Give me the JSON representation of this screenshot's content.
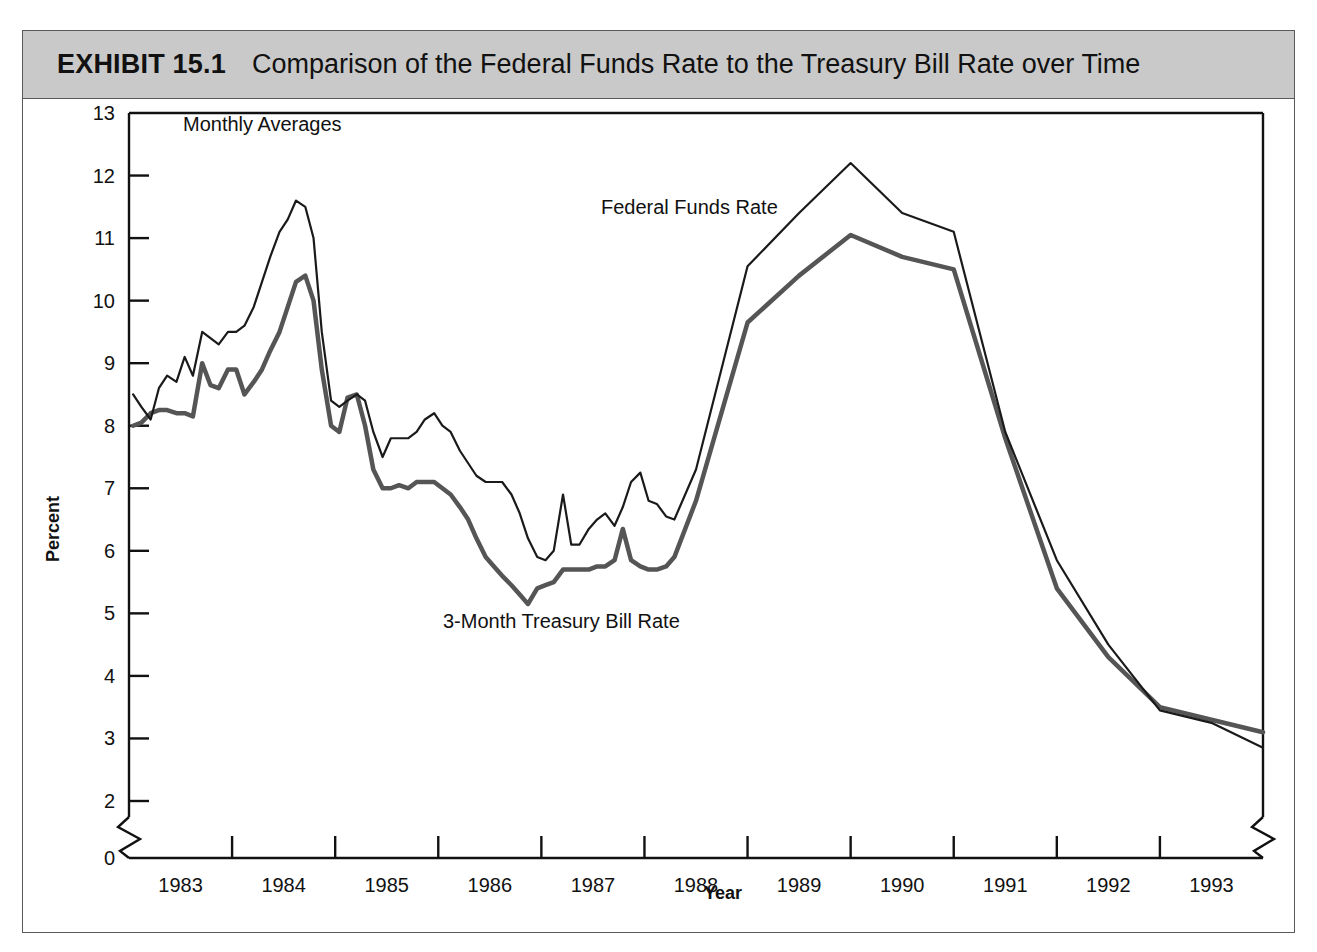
{
  "exhibit": {
    "number": "EXHIBIT 15.1",
    "title": "Comparison of the Federal Funds Rate to the Treasury Bill Rate over Time"
  },
  "annotations": {
    "monthly_averages": "Monthly Averages",
    "federal_funds": "Federal Funds Rate",
    "treasury_bill": "3-Month Treasury Bill Rate"
  },
  "colors": {
    "federal_funds_line": "#1a1a1a",
    "treasury_bill_line": "#555555",
    "axis": "#111111",
    "title_band": "#c9c9c9",
    "frame": "#5a5a5a"
  },
  "chart_data": {
    "type": "line",
    "title": "Comparison of the Federal Funds Rate to the Treasury Bill Rate over Time",
    "subtitle": "Monthly Averages",
    "xlabel": "Year",
    "ylabel": "Percent",
    "xlim": [
      1982.5,
      1993.5
    ],
    "ylim": [
      0,
      13
    ],
    "y_axis_break": [
      0.4,
      2.0
    ],
    "x_axis_break_left": true,
    "x_axis_break_right": true,
    "grid": false,
    "legend": "inline-annotations",
    "ytick_labels": [
      "0",
      "2",
      "3",
      "4",
      "5",
      "6",
      "7",
      "8",
      "9",
      "10",
      "11",
      "12",
      "13"
    ],
    "ytick_values": [
      0,
      2,
      3,
      4,
      5,
      6,
      7,
      8,
      9,
      10,
      11,
      12,
      13
    ],
    "xtick_labels": [
      "1983",
      "1984",
      "1985",
      "1986",
      "1987",
      "1988",
      "1989",
      "1990",
      "1991",
      "1992",
      "1993"
    ],
    "xtick_values": [
      1983,
      1984,
      1985,
      1986,
      1987,
      1988,
      1989,
      1990,
      1991,
      1992,
      1993
    ],
    "x_minor_tick_values": [
      1983.5,
      1984.5,
      1985.5,
      1986.5,
      1987.5,
      1988.5,
      1989.5,
      1990.5,
      1991.5,
      1992.5
    ],
    "series": [
      {
        "name": "Federal Funds Rate",
        "color": "#1a1a1a",
        "width": 2.2,
        "x": [
          1982.54,
          1982.62,
          1982.71,
          1982.79,
          1982.87,
          1982.96,
          1983.04,
          1983.12,
          1983.21,
          1983.29,
          1983.37,
          1983.46,
          1983.54,
          1983.62,
          1983.71,
          1983.79,
          1983.87,
          1983.96,
          1984.04,
          1984.12,
          1984.21,
          1984.29,
          1984.37,
          1984.46,
          1984.54,
          1984.62,
          1984.71,
          1984.79,
          1984.87,
          1984.96,
          1985.04,
          1985.12,
          1985.21,
          1985.29,
          1985.37,
          1985.46,
          1985.54,
          1985.62,
          1985.71,
          1985.79,
          1985.87,
          1985.96,
          1986.04,
          1986.12,
          1986.21,
          1986.29,
          1986.37,
          1986.46,
          1986.54,
          1986.62,
          1986.71,
          1986.79,
          1986.87,
          1986.96,
          1987.04,
          1987.12,
          1987.21,
          1987.29,
          1987.37,
          1987.46,
          1987.54,
          1987.62,
          1987.71,
          1987.79,
          1988.0,
          1988.5,
          1989.0,
          1989.5,
          1990.0,
          1990.5,
          1991.0,
          1991.5,
          1992.0,
          1992.5,
          1993.0,
          1993.5
        ],
        "y": [
          8.5,
          8.3,
          8.1,
          8.6,
          8.8,
          8.7,
          9.1,
          8.8,
          9.5,
          9.4,
          9.3,
          9.5,
          9.5,
          9.6,
          9.9,
          10.3,
          10.7,
          11.1,
          11.3,
          11.6,
          11.5,
          11.0,
          9.5,
          8.4,
          8.3,
          8.4,
          8.5,
          8.4,
          7.9,
          7.5,
          7.8,
          7.8,
          7.8,
          7.9,
          8.1,
          8.2,
          8.0,
          7.9,
          7.6,
          7.4,
          7.2,
          7.1,
          7.1,
          7.1,
          6.9,
          6.6,
          6.2,
          5.9,
          5.85,
          6.0,
          6.9,
          6.1,
          6.1,
          6.35,
          6.5,
          6.6,
          6.4,
          6.7,
          7.1,
          7.25,
          6.8,
          6.75,
          6.55,
          6.5,
          7.3,
          10.55,
          11.4,
          12.2,
          11.4,
          11.1,
          7.9,
          5.85,
          4.5,
          3.45,
          3.25,
          2.85
        ]
      },
      {
        "name": "3-Month Treasury Bill Rate",
        "color": "#555555",
        "width": 4.5,
        "x": [
          1982.54,
          1982.62,
          1982.71,
          1982.79,
          1982.87,
          1982.96,
          1983.04,
          1983.12,
          1983.21,
          1983.29,
          1983.37,
          1983.46,
          1983.54,
          1983.62,
          1983.71,
          1983.79,
          1983.87,
          1983.96,
          1984.04,
          1984.12,
          1984.21,
          1984.29,
          1984.37,
          1984.46,
          1984.54,
          1984.62,
          1984.71,
          1984.79,
          1984.87,
          1984.96,
          1985.04,
          1985.12,
          1985.21,
          1985.29,
          1985.37,
          1985.46,
          1985.54,
          1985.62,
          1985.71,
          1985.79,
          1985.87,
          1985.96,
          1986.04,
          1986.12,
          1986.21,
          1986.29,
          1986.37,
          1986.46,
          1986.54,
          1986.62,
          1986.71,
          1986.79,
          1986.87,
          1986.96,
          1987.04,
          1987.12,
          1987.21,
          1987.29,
          1987.37,
          1987.46,
          1987.54,
          1987.62,
          1987.71,
          1987.79,
          1988.0,
          1988.5,
          1989.0,
          1989.5,
          1990.0,
          1990.5,
          1991.0,
          1991.5,
          1992.0,
          1992.5,
          1993.0,
          1993.5
        ],
        "y": [
          8.0,
          8.05,
          8.2,
          8.25,
          8.25,
          8.2,
          8.2,
          8.15,
          9.0,
          8.65,
          8.6,
          8.9,
          8.9,
          8.5,
          8.7,
          8.9,
          9.2,
          9.5,
          9.9,
          10.3,
          10.4,
          10.0,
          8.9,
          8.0,
          7.9,
          8.45,
          8.5,
          8.0,
          7.3,
          7.0,
          7.0,
          7.05,
          7.0,
          7.1,
          7.1,
          7.1,
          7.0,
          6.9,
          6.7,
          6.5,
          6.2,
          5.9,
          5.75,
          5.6,
          5.45,
          5.3,
          5.15,
          5.4,
          5.45,
          5.5,
          5.7,
          5.7,
          5.7,
          5.7,
          5.75,
          5.75,
          5.85,
          6.35,
          5.85,
          5.75,
          5.7,
          5.7,
          5.75,
          5.9,
          6.8,
          9.65,
          10.4,
          11.05,
          10.7,
          10.5,
          7.8,
          5.4,
          4.3,
          3.5,
          3.3,
          3.1
        ]
      }
    ]
  }
}
